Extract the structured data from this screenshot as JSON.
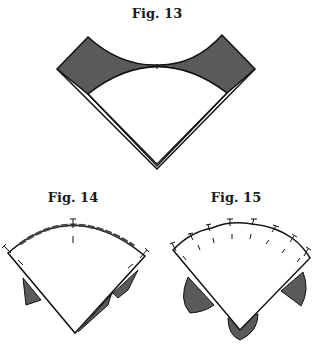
{
  "figures": [
    {
      "id": "fig13",
      "label": "Fig. 13",
      "description": "Square folded into a kite with concave gray corners"
    },
    {
      "id": "fig14",
      "label": "Fig. 14",
      "description": "Fan wedge with basted curved edge and gray flaps underneath"
    },
    {
      "id": "fig15",
      "label": "Fig. 15",
      "description": "Fan wedge pinned along scalloped edge with three gray lobes"
    }
  ],
  "colors": {
    "fill_gray": "#5a5a5a",
    "outline": "#111111",
    "paper": "#ffffff"
  }
}
